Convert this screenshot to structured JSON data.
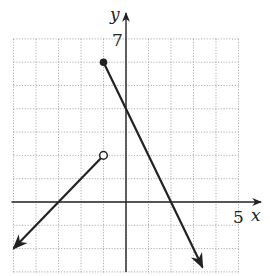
{
  "chart_data": {
    "type": "line",
    "title": "",
    "xlabel": "x",
    "ylabel": "y",
    "xlim": [
      -5,
      5
    ],
    "ylim": [
      -3,
      7
    ],
    "grid": true,
    "grid_style": "dotted",
    "tick_labels": {
      "x": [
        "5"
      ],
      "y": [
        "7"
      ]
    },
    "series": [
      {
        "name": "left piece",
        "equation": "y = x + 3",
        "domain": "x < -1",
        "points": [
          [
            -5,
            -2
          ],
          [
            -3,
            0
          ],
          [
            -1,
            2
          ]
        ],
        "start": "arrow",
        "end_marker": "open-circle",
        "end_point": [
          -1,
          2
        ]
      },
      {
        "name": "right piece",
        "equation": "y = -2x + 4",
        "domain": "x >= -1",
        "points": [
          [
            -1,
            6
          ],
          [
            0,
            4
          ],
          [
            2,
            0
          ],
          [
            3.4,
            -2.8
          ]
        ],
        "start_marker": "closed-dot",
        "start_point": [
          -1,
          6
        ],
        "end": "arrow"
      }
    ],
    "colors": {
      "line": "#222222",
      "grid": "#9a9a9a",
      "axis": "#222222"
    }
  },
  "labels": {
    "x_axis": "x",
    "y_axis": "y",
    "x_tick": "5",
    "y_tick": "7"
  }
}
